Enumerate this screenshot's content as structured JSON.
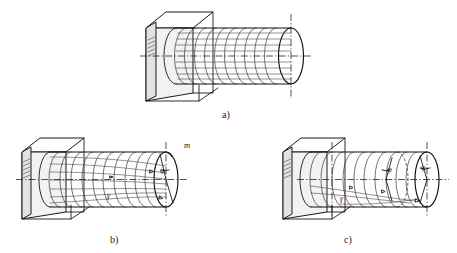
{
  "figure": {
    "background_color": "#ffffff",
    "line_color": "#1a1a1a",
    "width": 457,
    "height": 253
  },
  "panels": [
    {
      "id": "a",
      "caption": "a)",
      "description": "Wall-mounted cylinder with straight circumferential ribs and horizontal generator lines (undeformed state)",
      "rib_count": 11,
      "generator_count": 9,
      "has_centerline": true,
      "labels": []
    },
    {
      "id": "b",
      "caption": "b)",
      "description": "Wall-mounted cylinder under torsion with helical lines converging to free end; angle of twist marked",
      "rib_count": 11,
      "generator_count": 7,
      "has_centerline": true,
      "labels": [
        {
          "name": "point-label-m",
          "text": "m",
          "role": "free-end point marker"
        },
        {
          "name": "angle-label-phi",
          "text": "φ",
          "role": "angle of twist at free end"
        },
        {
          "name": "angle-label-gamma",
          "text": "γ",
          "role": "shear angle on surface"
        }
      ]
    },
    {
      "id": "c",
      "caption": "c)",
      "description": "Wall-mounted cylinder showing progressive twist: intermediate and end cross-section rotation angles",
      "rib_count": 11,
      "generator_count": 0,
      "has_centerline": true,
      "has_hidden_arc": true,
      "labels": [
        {
          "name": "angle-label-phi-mid",
          "text": "φ",
          "role": "angle of twist at intermediate section"
        },
        {
          "name": "angle-label-phi-end",
          "text": "φ",
          "role": "angle of twist at free end"
        },
        {
          "name": "angle-label-gamma",
          "text": "γ",
          "role": "shear angle on surface"
        }
      ]
    }
  ],
  "captions": {
    "a": "a)",
    "b": "b)",
    "c": "c)"
  },
  "symbols": {
    "m": "m",
    "phi": "φ",
    "gamma": "γ"
  }
}
